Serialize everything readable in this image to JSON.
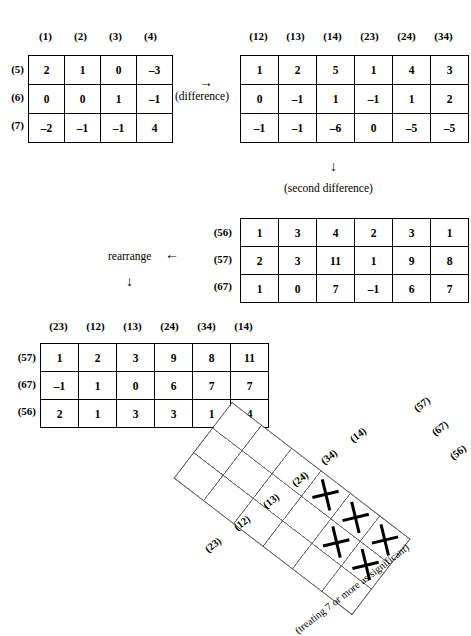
{
  "figure": {
    "tables": [
      {
        "id": "first-table",
        "col_headers": [
          "(1)",
          "(2)",
          "(3)",
          "(4)"
        ],
        "row_headers": [
          "(5)",
          "(6)",
          "(7)"
        ],
        "rows": [
          [
            "2",
            "1",
            "0",
            "–3"
          ],
          [
            "0",
            "0",
            "1",
            "–1"
          ],
          [
            "–2",
            "–1",
            "–1",
            "4"
          ]
        ]
      },
      {
        "id": "difference-table",
        "col_headers": [
          "(12)",
          "(13)",
          "(14)",
          "(23)",
          "(24)",
          "(34)"
        ],
        "row_headers": [
          "",
          "",
          ""
        ],
        "rows": [
          [
            "1",
            "2",
            "5",
            "1",
            "4",
            "3"
          ],
          [
            "0",
            "–1",
            "1",
            "–1",
            "1",
            "2"
          ],
          [
            "–1",
            "–1",
            "–6",
            "0",
            "–5",
            "–5"
          ]
        ]
      },
      {
        "id": "second-difference-table",
        "col_headers": [],
        "row_headers": [
          "(56)",
          "(57)",
          "(67)"
        ],
        "rows": [
          [
            "1",
            "3",
            "4",
            "2",
            "3",
            "1"
          ],
          [
            "2",
            "3",
            "11",
            "1",
            "9",
            "8"
          ],
          [
            "1",
            "0",
            "7",
            "–1",
            "6",
            "7"
          ]
        ]
      },
      {
        "id": "rearranged-table",
        "col_headers": [
          "(23)",
          "(12)",
          "(13)",
          "(24)",
          "(34)",
          "(14)"
        ],
        "row_headers": [
          "(57)",
          "(67)",
          "(56)"
        ],
        "rows": [
          [
            "1",
            "2",
            "3",
            "9",
            "8",
            "11"
          ],
          [
            "–1",
            "1",
            "0",
            "6",
            "7",
            "7"
          ],
          [
            "2",
            "1",
            "3",
            "3",
            "1",
            "4"
          ]
        ]
      }
    ],
    "annotations": {
      "difference_arrow": "→",
      "difference_label": "(difference)",
      "second_difference_arrow": "↓",
      "second_difference_label": "(second difference)",
      "rearrange_label": "rearrange",
      "rearrange_arrow": "←",
      "rearrange_down_arrow": "↓"
    },
    "tilted_grid": {
      "col_headers": [
        "(23)",
        "(12)",
        "(13)",
        "(24)",
        "(34)",
        "(14)"
      ],
      "row_headers": [
        "(57)",
        "(67)",
        "(56)"
      ],
      "caption": "(treating 7 or more as significant)",
      "marks": [
        [
          "",
          "",
          "",
          "x",
          "x",
          "x"
        ],
        [
          "",
          "",
          "",
          "",
          "x",
          "x"
        ],
        [
          "",
          "",
          "",
          "",
          "",
          ""
        ]
      ]
    }
  }
}
